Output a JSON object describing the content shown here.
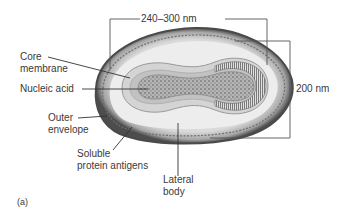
{
  "figure": {
    "panel_label": "(a)",
    "dimensions": {
      "length": "240–300 nm",
      "width": "200 nm"
    },
    "labels": {
      "core_membrane": [
        "Core",
        "membrane"
      ],
      "nucleic_acid": "Nucleic acid",
      "outer_envelope": [
        "Outer",
        "envelope"
      ],
      "soluble_protein_antigens": [
        "Soluble",
        "protein antigens"
      ],
      "lateral_body": [
        "Lateral",
        "body"
      ]
    },
    "colors": {
      "outer_rim": "#5a5a5a",
      "envelope_fill": "#cfcfcf",
      "lateral_body_fill": "#ececec",
      "core_fill": "#bdbdbd",
      "nucleic_acid_fill": "#8c8c8c",
      "leader_line": "#333333"
    }
  }
}
